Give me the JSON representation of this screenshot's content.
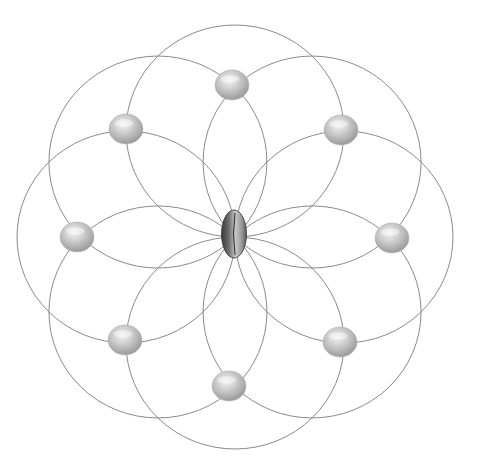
{
  "diagram": {
    "colors": {
      "background": "#ffffff",
      "ring_stroke": "#8a8a8a",
      "node_light": "#eeeeee",
      "node_mid": "#c4c4c4",
      "node_dark": "#9a9a9a",
      "center_light": "#d8d8d8",
      "center_mid": "#8c8c8c",
      "center_dark": "#3a3a3a"
    },
    "center": {
      "x": 235,
      "y": 237
    },
    "ring_radius_x": 109,
    "ring_radius_y": 106,
    "ring_count": 8,
    "center_node": {
      "name": "center-node",
      "x": 234,
      "y": 234,
      "rx": 12.5,
      "ry": 24
    },
    "nodes": [
      {
        "name": "node-top",
        "x": 232,
        "y": 85
      },
      {
        "name": "node-top-right",
        "x": 341,
        "y": 130
      },
      {
        "name": "node-right",
        "x": 392,
        "y": 238
      },
      {
        "name": "node-bottom-right",
        "x": 340,
        "y": 342
      },
      {
        "name": "node-bottom",
        "x": 229,
        "y": 386
      },
      {
        "name": "node-bottom-left",
        "x": 125,
        "y": 340
      },
      {
        "name": "node-left",
        "x": 77,
        "y": 237
      },
      {
        "name": "node-top-left",
        "x": 126,
        "y": 129
      }
    ],
    "node_rx": 17,
    "node_ry": 15
  }
}
